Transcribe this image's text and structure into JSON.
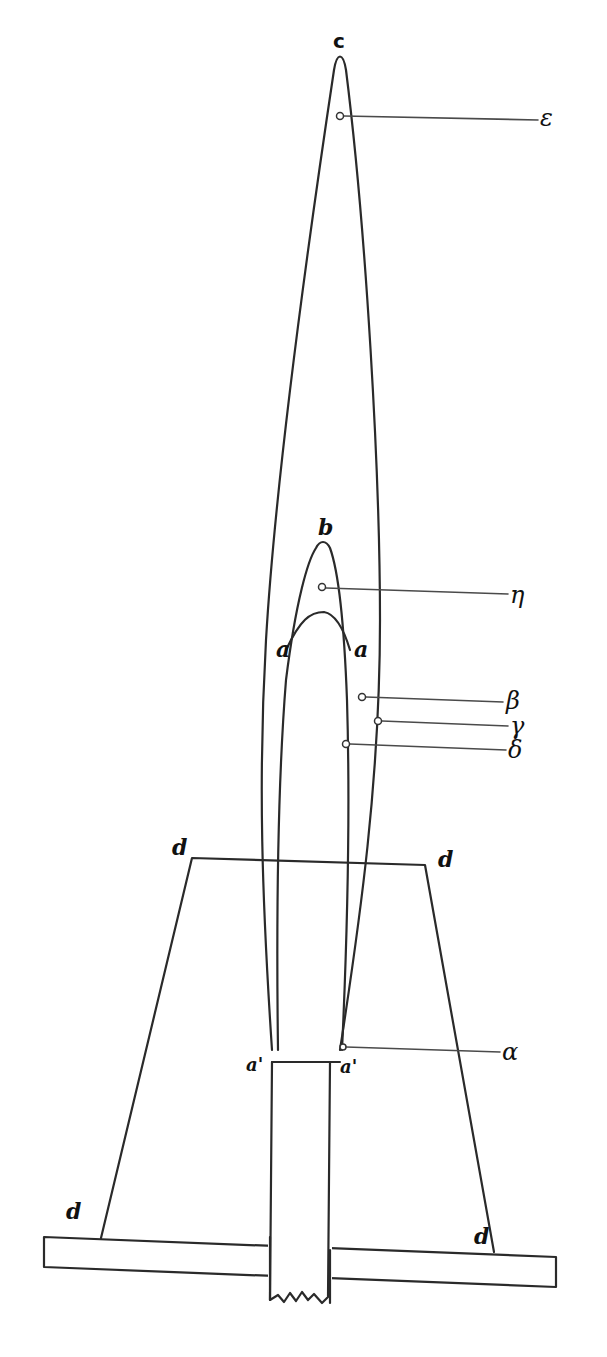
{
  "figure": {
    "colors": {
      "ink": "#2a2a2a",
      "background": "#ffffff"
    },
    "labels": {
      "c": "c",
      "b": "b",
      "a_left": "a",
      "a_right": "a",
      "a_prime_left": "a'",
      "a_prime_right": "a'",
      "d_top_left": "d",
      "d_top_right": "d",
      "d_bottom_left": "d",
      "d_bottom_right": "d"
    },
    "pointers": [
      {
        "id": "epsilon",
        "label": "ε"
      },
      {
        "id": "eta",
        "label": "η"
      },
      {
        "id": "beta",
        "label": "β"
      },
      {
        "id": "gamma",
        "label": "γ"
      },
      {
        "id": "delta",
        "label": "δ"
      },
      {
        "id": "alpha",
        "label": "α"
      }
    ]
  }
}
